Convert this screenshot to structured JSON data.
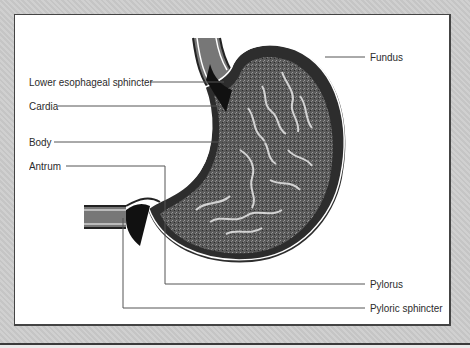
{
  "diagram": {
    "labels_left": [
      {
        "id": "lower-esophageal-sphincter",
        "text": "Lower esophageal sphincter"
      },
      {
        "id": "cardia",
        "text": "Cardia"
      },
      {
        "id": "body",
        "text": "Body"
      },
      {
        "id": "antrum",
        "text": "Antrum"
      }
    ],
    "labels_right": [
      {
        "id": "fundus",
        "text": "Fundus"
      },
      {
        "id": "pylorus",
        "text": "Pylorus"
      },
      {
        "id": "pyloric-sphincter",
        "text": "Pyloric sphincter"
      }
    ],
    "colors": {
      "frame": "#cdcdcd",
      "panel": "#ffffff",
      "leader_line": "#555555",
      "tissue_dark": "#3c3c3c",
      "tissue_mid": "#6e6e6e",
      "sphincter": "#111111"
    }
  }
}
